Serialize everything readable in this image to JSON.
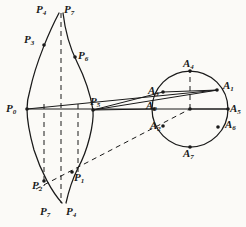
{
  "figure": {
    "background_color": "#fbfaf7",
    "ink_color": "#1a1a1a",
    "stroke_width": 1.0,
    "width": 246,
    "height": 227,
    "circle": {
      "name": "generating-circle",
      "cx": 190,
      "cy": 109,
      "r": 38
    },
    "curve_labels": [
      {
        "id": "P0",
        "base": "P",
        "sub": "0",
        "x": 6,
        "y": 103,
        "point_x": 27,
        "point_y": 109
      },
      {
        "id": "P4_top",
        "base": "P",
        "sub": "4",
        "x": 36,
        "y": 4,
        "point_x": 59,
        "point_y": 13
      },
      {
        "id": "P7_top",
        "base": "P",
        "sub": "7",
        "x": 64,
        "y": 4,
        "point_x": 63,
        "point_y": 13
      },
      {
        "id": "P3",
        "base": "P",
        "sub": "3",
        "x": 24,
        "y": 34,
        "point_x": 44,
        "point_y": 45
      },
      {
        "id": "P6",
        "base": "P",
        "sub": "6",
        "x": 78,
        "y": 50,
        "point_x": 75,
        "point_y": 57
      },
      {
        "id": "P5",
        "base": "P",
        "sub": "5",
        "x": 90,
        "y": 96,
        "point_x": 93,
        "point_y": 110
      },
      {
        "id": "P1",
        "base": "P",
        "sub": "1",
        "x": 74,
        "y": 172,
        "point_x": 72,
        "point_y": 172
      },
      {
        "id": "P2",
        "base": "P",
        "sub": "2",
        "x": 32,
        "y": 180,
        "point_x": 44,
        "point_y": 180
      },
      {
        "id": "P7_bot",
        "base": "P",
        "sub": "7",
        "x": 40,
        "y": 206,
        "point_x": 62,
        "point_y": 203
      },
      {
        "id": "P4_bot",
        "base": "P",
        "sub": "4",
        "x": 66,
        "y": 206,
        "point_x": 66,
        "point_y": 203
      }
    ],
    "circle_labels": [
      {
        "id": "A4",
        "base": "A",
        "sub": "4",
        "x": 183,
        "y": 58,
        "point_x": 190,
        "point_y": 71
      },
      {
        "id": "A1",
        "base": "A",
        "sub": "1",
        "x": 223,
        "y": 80,
        "point_x": 217,
        "point_y": 90
      },
      {
        "id": "A5",
        "base": "A",
        "sub": "5",
        "x": 230,
        "y": 103,
        "point_x": 228,
        "point_y": 109
      },
      {
        "id": "A6",
        "base": "A",
        "sub": "6",
        "x": 225,
        "y": 119,
        "point_x": 218,
        "point_y": 127
      },
      {
        "id": "A7",
        "base": "A",
        "sub": "7",
        "x": 183,
        "y": 148,
        "point_x": 190,
        "point_y": 147
      },
      {
        "id": "A3",
        "base": "A",
        "sub": "3",
        "x": 148,
        "y": 85,
        "point_x": 163,
        "point_y": 92
      },
      {
        "id": "A0",
        "base": "A",
        "sub": "0",
        "x": 146,
        "y": 100,
        "point_x": 152,
        "point_y": 109
      },
      {
        "id": "A2",
        "base": "A",
        "sub": "2",
        "x": 150,
        "y": 120,
        "point_x": 163,
        "point_y": 126
      }
    ],
    "solid_curves": [
      {
        "name": "outer-left-curve",
        "d": "M 59 13 C 50 30 36 62 30 90 C 27 100 27 105 27 109 C 27 118 29 132 34 150 C 41 172 52 192 62 203"
      },
      {
        "name": "inner-right-curve",
        "d": "M 63 13 C 65 30 70 48 77 62 C 85 78 91 98 93 110 C 94 124 88 150 78 168 C 72 180 68 194 66 203"
      }
    ],
    "dashed_curves": [
      {
        "name": "center-dashed-axis",
        "d": "M 61 13 L 61 203"
      }
    ],
    "dashed_verticals": [
      {
        "name": "dashed-vertical-left",
        "x": 44,
        "y1": 104,
        "y2": 186
      },
      {
        "name": "dashed-vertical-right",
        "x": 78,
        "y1": 104,
        "y2": 176
      }
    ],
    "solid_lines": [
      {
        "name": "line-P0-to-A5",
        "x1": 27,
        "y1": 109,
        "x2": 229,
        "y2": 109
      },
      {
        "name": "line-P0-to-A1",
        "x1": 27,
        "y1": 109,
        "x2": 218,
        "y2": 90
      },
      {
        "name": "line-P5-to-A1",
        "x1": 93,
        "y1": 110,
        "x2": 218,
        "y2": 90
      },
      {
        "name": "line-P5-to-A0",
        "x1": 93,
        "y1": 110,
        "x2": 152,
        "y2": 109
      },
      {
        "name": "line-P5-to-A3",
        "x1": 93,
        "y1": 110,
        "x2": 163,
        "y2": 92
      },
      {
        "name": "chord-A3-to-A1",
        "x1": 163,
        "y1": 92,
        "x2": 218,
        "y2": 90
      },
      {
        "name": "radius-center-to-A5",
        "x1": 190,
        "y1": 109,
        "x2": 228,
        "y2": 109
      }
    ],
    "dashed_lines": [
      {
        "name": "dashed-P2-to-A2",
        "x1": 36,
        "y1": 189,
        "x2": 190,
        "y2": 109
      },
      {
        "name": "dashed-radius-A4",
        "x1": 190,
        "y1": 109,
        "x2": 190,
        "y2": 71
      }
    ],
    "markers": [
      {
        "name": "point-P0",
        "x": 27,
        "y": 109
      },
      {
        "name": "point-P3",
        "x": 44,
        "y": 45
      },
      {
        "name": "point-P6",
        "x": 75,
        "y": 57
      },
      {
        "name": "point-P5",
        "x": 93,
        "y": 110
      },
      {
        "name": "point-P1",
        "x": 72,
        "y": 172
      },
      {
        "name": "point-P2",
        "x": 44,
        "y": 181
      },
      {
        "name": "point-A4",
        "x": 190,
        "y": 71
      },
      {
        "name": "point-A1",
        "x": 217,
        "y": 90
      },
      {
        "name": "point-A5",
        "x": 228,
        "y": 109
      },
      {
        "name": "point-A6",
        "x": 218,
        "y": 127
      },
      {
        "name": "point-A7",
        "x": 190,
        "y": 147
      },
      {
        "name": "point-A3",
        "x": 163,
        "y": 92
      },
      {
        "name": "point-A0",
        "x": 154,
        "y": 109
      },
      {
        "name": "point-A2",
        "x": 163,
        "y": 126
      },
      {
        "name": "point-circle-center",
        "x": 190,
        "y": 109
      }
    ]
  }
}
